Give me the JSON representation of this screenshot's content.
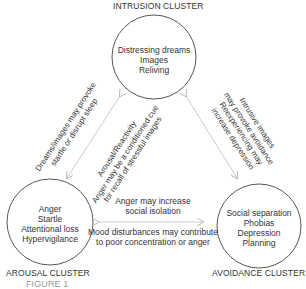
{
  "clusters": {
    "intrusion": {
      "label": "INTRUSION CLUSTER",
      "items": [
        "Distressing dreams",
        "Images",
        "Reliving"
      ]
    },
    "arousal": {
      "label": "AROUSAL CLUSTER",
      "items": [
        "Anger",
        "Startle",
        "Attentional loss",
        "Hypervigilance"
      ]
    },
    "avoidance": {
      "label": "AVOIDANCE CLUSTER",
      "items": [
        "Social separation",
        "Phobias",
        "Depression",
        "Planning"
      ]
    }
  },
  "links": {
    "intrusion_to_arousal": {
      "lines": [
        "Dreams/images may provoke",
        "startle or disrupt sleep"
      ]
    },
    "arousal_to_intrusion": {
      "lines": [
        "Arousal/Reactivity",
        "Anger may be a conditioned cue",
        "for recall of stressful images"
      ]
    },
    "intrusion_to_avoidance": {
      "lines": [
        "Intrusive images",
        "may provoke avoidance",
        "Reexperiencing may",
        "increase depression"
      ]
    },
    "arousal_to_avoidance": {
      "lines": [
        "Anger may increase",
        "social isolation"
      ]
    },
    "avoidance_to_arousal": {
      "lines": [
        "Mood disturbances may contribute",
        "to poor concentration or anger"
      ]
    }
  },
  "caption_fragment": "FIGURE 1"
}
